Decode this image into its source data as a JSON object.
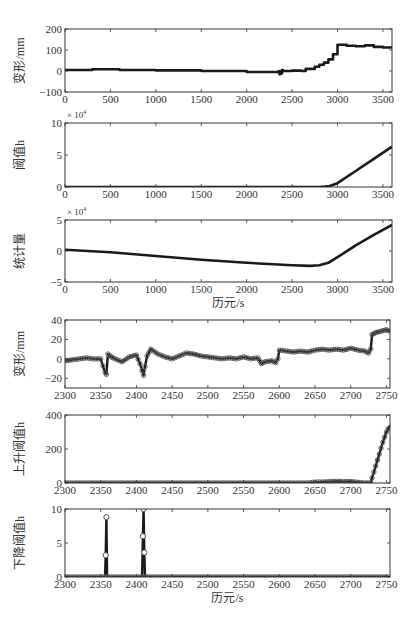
{
  "figure": {
    "background": "#ffffff",
    "line_color": "#1a1a1a",
    "marker_color": "#555555",
    "axis_color": "#333333"
  },
  "chart_data": [
    {
      "type": "line",
      "title": "",
      "xlabel": "",
      "ylabel": "变形/mm",
      "xlim": [
        0,
        3600
      ],
      "ylim": [
        -100,
        200
      ],
      "xticks": [
        0,
        500,
        1000,
        1500,
        2000,
        2500,
        3000,
        3500
      ],
      "yticks": [
        -100,
        0,
        100,
        200
      ],
      "exponent": "",
      "grid": false,
      "style": "step",
      "x": [
        0,
        300,
        600,
        1000,
        1500,
        2000,
        2350,
        2360,
        2370,
        2380,
        2390,
        2400,
        2500,
        2600,
        2650,
        2700,
        2720,
        2750,
        2780,
        2800,
        2830,
        2850,
        2880,
        2900,
        2930,
        2950,
        2970,
        3000,
        3100,
        3200,
        3300,
        3400,
        3500,
        3600
      ],
      "values": [
        5,
        8,
        5,
        3,
        0,
        -5,
        -2,
        -15,
        0,
        -12,
        5,
        0,
        2,
        0,
        10,
        10,
        10,
        20,
        20,
        30,
        30,
        40,
        40,
        55,
        55,
        80,
        80,
        125,
        120,
        118,
        122,
        115,
        112,
        108
      ]
    },
    {
      "type": "line",
      "title": "",
      "xlabel": "",
      "ylabel": "阈值h",
      "xlim": [
        0,
        3600
      ],
      "ylim": [
        0,
        10
      ],
      "xticks": [
        0,
        500,
        1000,
        1500,
        2000,
        2500,
        3000,
        3500
      ],
      "yticks": [
        0,
        5,
        10
      ],
      "exponent": "× 10^4",
      "grid": false,
      "style": "line",
      "x": [
        0,
        500,
        1000,
        1500,
        2000,
        2500,
        2800,
        2900,
        3000,
        3200,
        3400,
        3600
      ],
      "values": [
        0,
        0,
        0,
        0,
        0,
        0,
        0,
        0.1,
        0.6,
        2.5,
        4.4,
        6.3
      ]
    },
    {
      "type": "line",
      "title": "",
      "xlabel": "历元/s",
      "ylabel": "统计量",
      "xlim": [
        0,
        3600
      ],
      "ylim": [
        -5,
        5
      ],
      "xticks": [
        0,
        500,
        1000,
        1500,
        2000,
        2500,
        3000,
        3500
      ],
      "yticks": [
        -5,
        0,
        5
      ],
      "exponent": "× 10^4",
      "grid": false,
      "style": "line",
      "x": [
        0,
        500,
        1000,
        1500,
        2000,
        2500,
        2700,
        2800,
        2900,
        3000,
        3200,
        3400,
        3600
      ],
      "values": [
        0.2,
        -0.2,
        -0.8,
        -1.4,
        -1.9,
        -2.3,
        -2.4,
        -2.3,
        -1.9,
        -1.0,
        0.9,
        2.6,
        4.2
      ]
    },
    {
      "type": "scatter",
      "title": "",
      "xlabel": "",
      "ylabel": "变形/mm",
      "xlim": [
        2300,
        2755
      ],
      "ylim": [
        -30,
        40
      ],
      "xticks": [
        2300,
        2350,
        2400,
        2450,
        2500,
        2550,
        2600,
        2650,
        2700,
        2750
      ],
      "yticks": [
        -20,
        0,
        20,
        40
      ],
      "exponent": "",
      "grid": false,
      "style": "line-marker",
      "x": [
        2300,
        2310,
        2320,
        2330,
        2340,
        2350,
        2356,
        2358,
        2360,
        2365,
        2370,
        2380,
        2390,
        2400,
        2405,
        2408,
        2410,
        2412,
        2415,
        2420,
        2430,
        2440,
        2450,
        2460,
        2470,
        2480,
        2490,
        2500,
        2510,
        2520,
        2530,
        2540,
        2550,
        2560,
        2570,
        2575,
        2580,
        2590,
        2595,
        2598,
        2600,
        2610,
        2620,
        2630,
        2640,
        2650,
        2660,
        2670,
        2680,
        2690,
        2700,
        2710,
        2720,
        2725,
        2728,
        2730,
        2735,
        2740,
        2745,
        2750,
        2755
      ],
      "values": [
        -2,
        -1,
        0,
        1,
        0,
        0,
        -14,
        -16,
        5,
        2,
        0,
        -3,
        2,
        4,
        -5,
        -12,
        -17,
        -8,
        3,
        10,
        5,
        2,
        0,
        3,
        6,
        5,
        3,
        2,
        1,
        0,
        1,
        0,
        2,
        0,
        1,
        -5,
        -3,
        -2,
        -4,
        0,
        9,
        8,
        7,
        8,
        7,
        9,
        10,
        9,
        10,
        9,
        11,
        9,
        8,
        6,
        10,
        25,
        27,
        28,
        29,
        30,
        28
      ]
    },
    {
      "type": "scatter",
      "title": "",
      "xlabel": "",
      "ylabel": "上升阈值h",
      "xlim": [
        2300,
        2755
      ],
      "ylim": [
        0,
        400
      ],
      "xticks": [
        2300,
        2350,
        2400,
        2450,
        2500,
        2550,
        2600,
        2650,
        2700,
        2750
      ],
      "yticks": [
        0,
        200,
        400
      ],
      "exponent": "",
      "grid": false,
      "style": "line-marker",
      "x": [
        2300,
        2400,
        2500,
        2600,
        2640,
        2650,
        2660,
        2670,
        2680,
        2690,
        2700,
        2710,
        2720,
        2728,
        2730,
        2735,
        2740,
        2745,
        2750,
        2755
      ],
      "values": [
        0,
        0,
        0,
        0,
        0,
        5,
        6,
        8,
        10,
        8,
        9,
        4,
        0,
        0,
        30,
        100,
        170,
        240,
        300,
        340
      ]
    },
    {
      "type": "scatter",
      "title": "",
      "xlabel": "历元/s",
      "ylabel": "下降阈值h",
      "xlim": [
        2300,
        2755
      ],
      "ylim": [
        0,
        10
      ],
      "xticks": [
        2300,
        2350,
        2400,
        2450,
        2500,
        2550,
        2600,
        2650,
        2700,
        2750
      ],
      "yticks": [
        0,
        5,
        10
      ],
      "exponent": "",
      "grid": false,
      "style": "stem-marker",
      "x": [
        2300,
        2356,
        2357,
        2358,
        2359,
        2360,
        2408,
        2409,
        2410,
        2411,
        2412,
        2413,
        2414,
        2450,
        2500,
        2600,
        2700,
        2755
      ],
      "values": [
        0,
        0,
        3.2,
        8.8,
        0,
        0,
        0,
        6.0,
        10.0,
        3.6,
        0,
        0,
        0,
        0,
        0,
        0,
        0,
        0
      ]
    }
  ],
  "axes_layout": [
    {
      "left": 65,
      "top": 29,
      "right": 392,
      "bottom": 92
    },
    {
      "left": 65,
      "top": 123,
      "right": 392,
      "bottom": 187
    },
    {
      "left": 65,
      "top": 220,
      "right": 392,
      "bottom": 282
    },
    {
      "left": 65,
      "top": 320,
      "right": 390,
      "bottom": 388
    },
    {
      "left": 65,
      "top": 415,
      "right": 390,
      "bottom": 483
    },
    {
      "left": 65,
      "top": 509,
      "right": 390,
      "bottom": 577
    }
  ]
}
